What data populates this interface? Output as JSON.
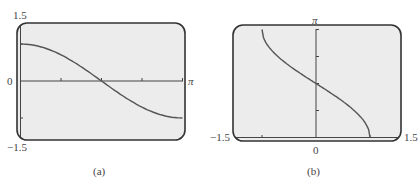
{
  "chart_data": [
    {
      "type": "line",
      "panel": "(a)",
      "title": "",
      "function": "y = cos(x)",
      "xlabel": "",
      "ylabel": "",
      "xlim": [
        0,
        3.14159
      ],
      "ylim": [
        -1.5,
        1.5
      ],
      "x_tick_labels": [
        "π"
      ],
      "y_tick_labels": [
        "1.5",
        "0",
        "-1.5"
      ],
      "x_ticks": [
        0.785,
        1.571,
        2.356,
        3.1416
      ],
      "y_ticks": [
        -1,
        1
      ],
      "grid": false,
      "series": [
        {
          "name": "cos x",
          "x": [
            0,
            0.393,
            0.785,
            1.178,
            1.571,
            1.963,
            2.356,
            2.749,
            3.1416
          ],
          "y": [
            1,
            0.924,
            0.707,
            0.383,
            0,
            -0.383,
            -0.707,
            -0.924,
            -1
          ]
        }
      ]
    },
    {
      "type": "line",
      "panel": "(b)",
      "title": "",
      "function": "y = arccos(x)",
      "xlabel": "",
      "ylabel": "",
      "xlim": [
        -1.5,
        1.5
      ],
      "ylim": [
        0,
        3.14159
      ],
      "x_tick_labels": [
        "-1.5",
        "0",
        "1.5"
      ],
      "y_tick_labels": [
        "π"
      ],
      "x_ticks": [
        -1,
        1
      ],
      "y_ticks": [
        0.785,
        1.571,
        2.356,
        3.1416
      ],
      "grid": false,
      "series": [
        {
          "name": "arccos x",
          "x": [
            -1,
            -0.924,
            -0.707,
            -0.383,
            0,
            0.383,
            0.707,
            0.924,
            1
          ],
          "y": [
            3.1416,
            2.749,
            2.356,
            1.964,
            1.571,
            1.178,
            0.785,
            0.393,
            0
          ]
        }
      ]
    }
  ],
  "panel_a": {
    "caption": "(a)",
    "label_ymax": "1.5",
    "label_zero": "0",
    "label_ymin": "−1.5",
    "label_xmax": "π"
  },
  "panel_b": {
    "caption": "(b)",
    "label_ymax": "π",
    "label_zero": "0",
    "label_xmin": "−1.5",
    "label_xmax": "1.5"
  },
  "colors": {
    "screen_bg": "#ececec",
    "frame": "#333333",
    "curve": "#555555",
    "axis": "#444444"
  }
}
